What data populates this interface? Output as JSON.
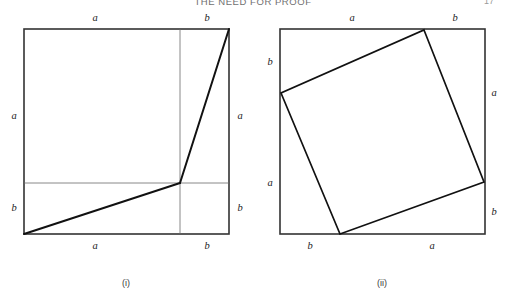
{
  "page": {
    "running_head": "THE NEED FOR PROOF",
    "page_number": "17",
    "background_color": "#ffffff",
    "ink_color": "#1a1a1a"
  },
  "figure": {
    "caption_i": "(i)",
    "caption_ii": "(ii)",
    "stroke_thin_color": "#555555",
    "stroke_bold_color": "#111111",
    "stroke_thin_width": 0.8,
    "stroke_bold_width": 1.9,
    "panels": [
      {
        "id": "panel-i",
        "caption": "(i)",
        "outer_square": {
          "x": 24,
          "y": 29,
          "size": 205
        },
        "division": {
          "vertical_x": 180,
          "horizontal_y": 183
        },
        "bold_segments": [
          {
            "name": "lower-diagonal",
            "x1": 24,
            "y1": 234,
            "x2": 180,
            "y2": 183
          },
          {
            "name": "upper-diagonal",
            "x1": 180,
            "y1": 183,
            "x2": 233,
            "y2": 29
          }
        ],
        "labels": [
          {
            "name": "top-a",
            "text": "a",
            "x": 95,
            "y": 18
          },
          {
            "name": "top-b",
            "text": "b",
            "x": 207,
            "y": 18
          },
          {
            "name": "left-a",
            "text": "a",
            "x": 14,
            "y": 116
          },
          {
            "name": "left-b",
            "text": "b",
            "x": 14,
            "y": 208
          },
          {
            "name": "right-a",
            "text": "a",
            "x": 240,
            "y": 116
          },
          {
            "name": "right-b",
            "text": "b",
            "x": 240,
            "y": 208
          },
          {
            "name": "bottom-a",
            "text": "a",
            "x": 95,
            "y": 246
          },
          {
            "name": "bottom-b",
            "text": "b",
            "x": 207,
            "y": 246
          }
        ]
      },
      {
        "id": "panel-ii",
        "caption": "(ii)",
        "outer_square": {
          "x": 280,
          "y": 29,
          "size": 205
        },
        "inscribed_square_vertices": [
          {
            "name": "top",
            "x": 424,
            "y": 30
          },
          {
            "name": "right",
            "x": 484,
            "y": 182
          },
          {
            "name": "bottom",
            "x": 340,
            "y": 234
          },
          {
            "name": "left",
            "x": 281,
            "y": 93
          }
        ],
        "labels": [
          {
            "name": "top-a",
            "text": "a",
            "x": 352,
            "y": 18
          },
          {
            "name": "top-b",
            "text": "b",
            "x": 455,
            "y": 18
          },
          {
            "name": "left-b",
            "text": "b",
            "x": 270,
            "y": 62
          },
          {
            "name": "left-a",
            "text": "a",
            "x": 270,
            "y": 183
          },
          {
            "name": "right-a",
            "text": "a",
            "x": 494,
            "y": 93
          },
          {
            "name": "right-b",
            "text": "b",
            "x": 494,
            "y": 212
          },
          {
            "name": "bottom-b",
            "text": "b",
            "x": 310,
            "y": 246
          },
          {
            "name": "bottom-a",
            "text": "a",
            "x": 432,
            "y": 246
          }
        ]
      }
    ]
  }
}
